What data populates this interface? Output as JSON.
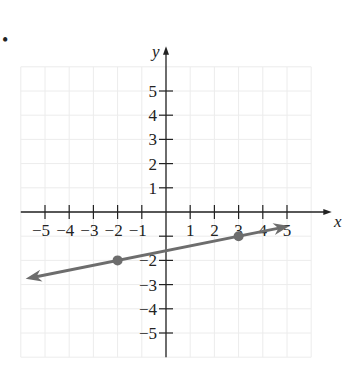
{
  "bullet": "•",
  "chart_data": {
    "type": "line",
    "title": "",
    "xlabel": "x",
    "ylabel": "y",
    "xlim": [
      -6,
      6
    ],
    "ylim": [
      -6,
      6
    ],
    "grid": true,
    "x_ticks": [
      -5,
      -4,
      -3,
      -2,
      -1,
      1,
      2,
      3,
      4,
      5
    ],
    "y_ticks": [
      -5,
      -4,
      -3,
      -2,
      -1,
      1,
      2,
      3,
      4,
      5
    ],
    "x_tick_labels": [
      "−5",
      "−4",
      "−3",
      "−2",
      "−1",
      "1",
      "2",
      "3",
      "4",
      "5"
    ],
    "y_tick_labels": [
      "−5",
      "−4",
      "−3",
      "−2",
      "1",
      "2",
      "3",
      "4",
      "5"
    ],
    "series": [
      {
        "name": "line",
        "points": [
          {
            "x": -2,
            "y": -2
          },
          {
            "x": 3,
            "y": -1
          }
        ],
        "slope": 0.2,
        "intercept": -1.6,
        "extends": [
          -5.8,
          5.1
        ],
        "arrows": "both",
        "color": "#6d6d6d"
      }
    ]
  }
}
